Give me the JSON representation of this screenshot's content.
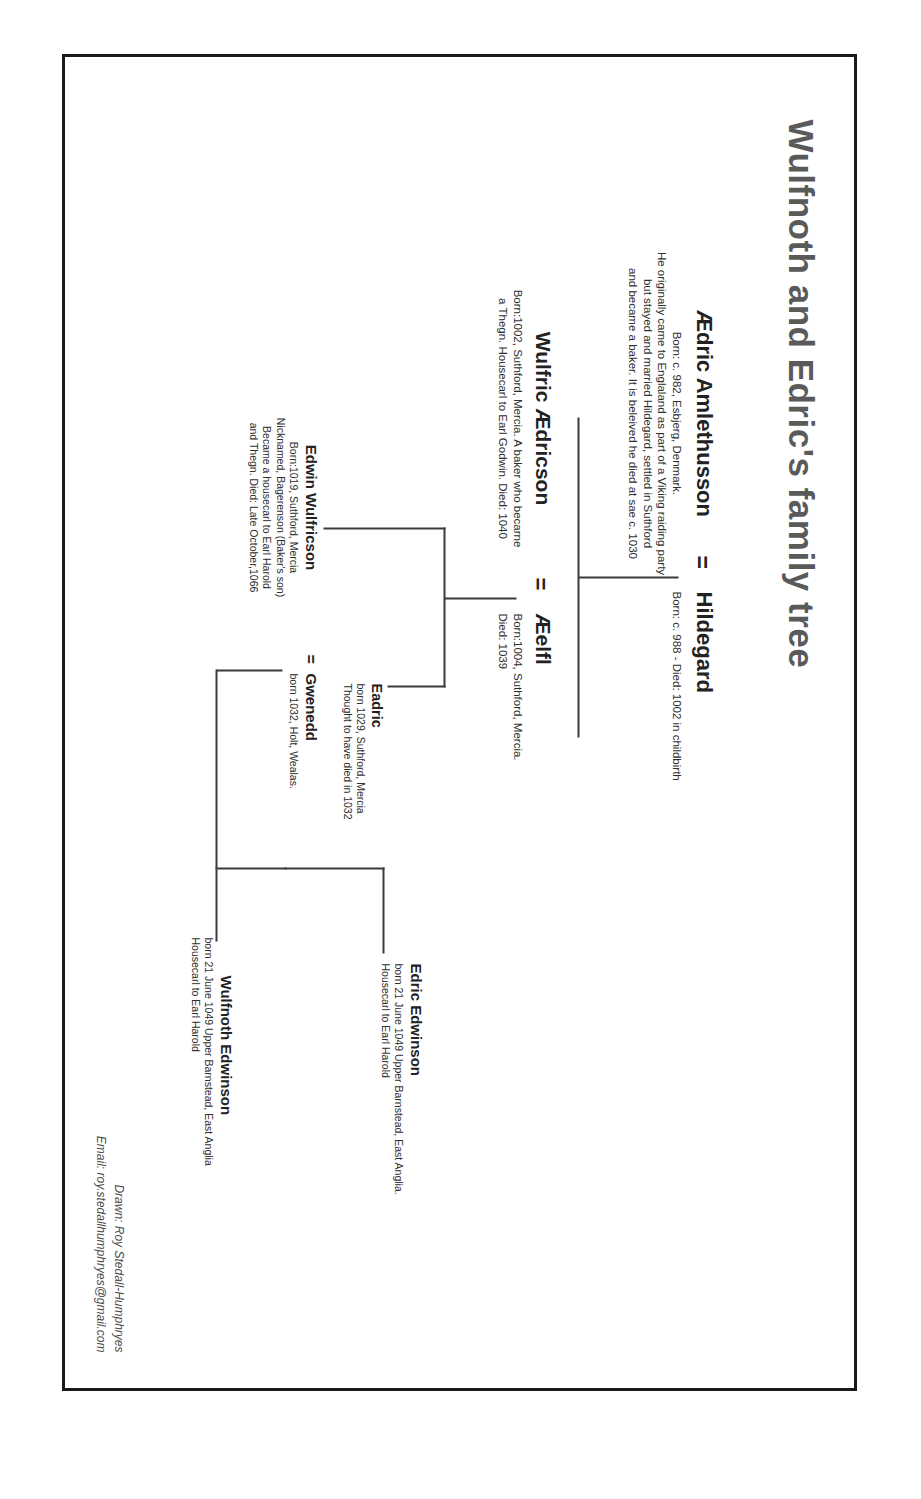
{
  "document": {
    "title": "Wulfnoth and Edric's family tree",
    "equals_symbol": "=",
    "accent_color": "#5a5a5a",
    "text_color": "#222222",
    "line_color": "#3a3a3a",
    "background": "#ffffff"
  },
  "people": {
    "aedric": {
      "name": "Ædric Amlethusson",
      "details": "Born: c. 982, Esbjerg, Denmark.",
      "bio_lines": [
        "He originally came to Englaland as part of a Viking raiding party",
        "but stayed and married Hildegard, settled in Suthford",
        "and became a baker. It is beleived he died at sae c. 1030"
      ]
    },
    "hildegard": {
      "name": "Hildegard",
      "details": "Born: c. 988 - Died: 1002 in childbirth"
    },
    "wulfric": {
      "name": "Wulfric Ædricson",
      "bio_lines": [
        "Born:1002, Suthford, Mercia. A baker who becarne",
        "a Thegn. Housecarl to Earl Godwin. Died: 1040"
      ]
    },
    "aelfi": {
      "name": "Æelfl",
      "bio_lines": [
        "Born:1004, Suthford, Mercia.",
        "Died: 1039"
      ]
    },
    "eadric": {
      "name": "Eadric",
      "bio_lines": [
        "born 1029, Suthford, Mercia",
        "Thought to have died in 1032"
      ]
    },
    "edwin": {
      "name": "Edwin Wulfricson",
      "bio_lines": [
        "Born:1019, Suthford, Mercia",
        "Nicknamed, Bagerenson (Baker's son)",
        "Became a housecarl to Earl Harold",
        "and Thegn. Died: Late October,1066"
      ]
    },
    "gwenedd": {
      "name": "Gwenedd",
      "bio_lines": [
        "born 1032, Holt, Wealas."
      ]
    },
    "edric_edwinson": {
      "name": "Edric Edwinson",
      "bio_lines": [
        "born 21 June 1049 Upper Barnstead, East Anglia.",
        "Housecarl to Earl Harold"
      ]
    },
    "wulfnoth_edwinson": {
      "name": "Wulfnoth Edwinson",
      "bio_lines": [
        "born 21 June 1049 Upper Barnstead, East Anglia",
        "Housecarl to Earl Harold"
      ]
    }
  },
  "credits": {
    "drawn_by": "Drawn: Roy Stedall-Humphryes",
    "email": "Email: roy.stedallhumphryes@gmail.com"
  }
}
